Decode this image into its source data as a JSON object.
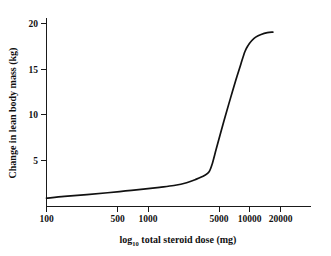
{
  "chart_data": {
    "type": "line",
    "title": "",
    "xlabel": "log10 total steroid dose (mg)",
    "xlabel_main": "log",
    "xlabel_sub": "10",
    "xlabel_rest": " total steroid dose (mg)",
    "ylabel": "Change in lean body mass (kg)",
    "xscale": "log",
    "xlim": [
      100,
      30000
    ],
    "ylim": [
      0,
      21.5
    ],
    "xticks": [
      100,
      500,
      1000,
      5000,
      10000,
      20000
    ],
    "xticklabels": [
      "100",
      "500",
      "1000",
      "5000",
      "10000",
      "20000"
    ],
    "yticks": [
      5,
      10,
      15,
      20
    ],
    "yticklabels": [
      "5",
      "10",
      "15",
      "20"
    ],
    "grid": false,
    "legend": null,
    "series": [
      {
        "name": "Change in lean body mass",
        "color": "#111111",
        "x": [
          100,
          150,
          250,
          400,
          600,
          900,
          1300,
          1800,
          2400,
          3000,
          3600,
          4000,
          4300,
          4700,
          5200,
          5800,
          6500,
          7300,
          8200,
          9000,
          9700,
          10500,
          11500,
          13000,
          15000,
          17000
        ],
        "y": [
          0.8,
          1.0,
          1.2,
          1.4,
          1.6,
          1.8,
          2.0,
          2.2,
          2.5,
          2.9,
          3.3,
          3.7,
          4.6,
          6.2,
          8.0,
          9.9,
          11.8,
          13.7,
          15.5,
          16.9,
          17.6,
          18.1,
          18.5,
          18.8,
          19.0,
          19.05
        ]
      }
    ]
  },
  "axis": {
    "y_label_text": "Change in lean body mass (kg)"
  }
}
